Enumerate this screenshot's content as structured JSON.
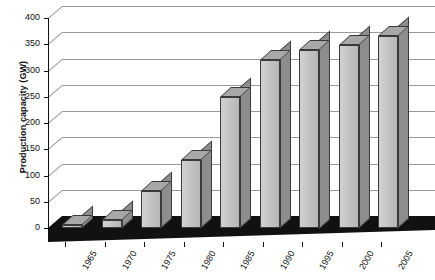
{
  "chart_data": {
    "type": "bar",
    "title": "",
    "xlabel": "",
    "ylabel": "Production capacity (GW)",
    "categories": [
      "1965",
      "1970",
      "1975",
      "1980",
      "1985",
      "1990",
      "1995",
      "2000",
      "2005"
    ],
    "values": [
      5,
      15,
      70,
      130,
      250,
      320,
      340,
      348,
      365
    ],
    "series": [
      {
        "name": "Production capacity",
        "values": [
          5,
          15,
          70,
          130,
          250,
          320,
          340,
          348,
          365
        ]
      }
    ],
    "ylim": [
      0,
      400
    ],
    "yticks": [
      0,
      50,
      100,
      150,
      200,
      250,
      300,
      350,
      400
    ],
    "ytick_labels": [
      "0",
      "50",
      "100",
      "150",
      "200",
      "250",
      "300",
      "350",
      "400"
    ],
    "grid": "horizontal",
    "legend": "none",
    "style": "3d-bar",
    "colors": {
      "bar_front": "#c2c2c2",
      "bar_side": "#8d8d8d",
      "bar_top": "#a8a8a8",
      "bar_edge": "#3a3a3a",
      "gridline": "#9a9a9a",
      "axis": "#111111",
      "floor": "#111111",
      "background": "#ffffff"
    }
  }
}
